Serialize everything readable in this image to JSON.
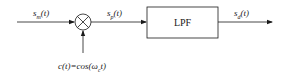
{
  "diagram": {
    "type": "block-diagram",
    "signals": {
      "input": {
        "label": "s",
        "sub": "m",
        "arg": "(t)"
      },
      "product": {
        "label": "s",
        "sub": "p",
        "arg": "(t)"
      },
      "output": {
        "label": "s",
        "sub": "d",
        "arg": "(t)"
      },
      "carrier": {
        "text": "c(t)=cos(ω",
        "sub": "c",
        "tail": "t)"
      }
    },
    "blocks": [
      {
        "id": "multiplier",
        "shape": "circle-cross",
        "label": ""
      },
      {
        "id": "lpf",
        "shape": "rectangle",
        "label": "LPF"
      }
    ],
    "colors": {
      "stroke": "#1a1a1a",
      "background": "#ffffff"
    }
  }
}
